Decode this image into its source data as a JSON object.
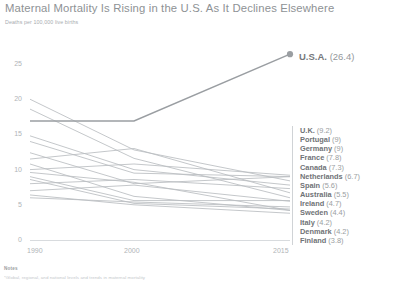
{
  "header": {
    "title": "Maternal Mortality Is Rising in the U.S. As It Declines Elsewhere",
    "subtitle": "Deaths per 100,000 live births"
  },
  "annotation": {
    "country": "U.S.A.",
    "value_label": "(26.4)"
  },
  "legend": {
    "items": [
      {
        "name": "U.K.",
        "value": "(9.2)"
      },
      {
        "name": "Portugal",
        "value": "(9)"
      },
      {
        "name": "Germany",
        "value": "(9)"
      },
      {
        "name": "France",
        "value": "(7.8)"
      },
      {
        "name": "Canada",
        "value": "(7.3)"
      },
      {
        "name": "Netherlands",
        "value": "(6.7)"
      },
      {
        "name": "Spain",
        "value": "(5.6)"
      },
      {
        "name": "Australia",
        "value": "(5.5)"
      },
      {
        "name": "Ireland",
        "value": "(4.7)"
      },
      {
        "name": "Sweden",
        "value": "(4.4)"
      },
      {
        "name": "Italy",
        "value": "(4.2)"
      },
      {
        "name": "Denmark",
        "value": "(4.2)"
      },
      {
        "name": "Finland",
        "value": "(3.8)"
      }
    ]
  },
  "notes": {
    "heading": "Notes",
    "body": "*Global, regional, and national levels and trends in maternal mortality"
  },
  "axis": {
    "y_ticks": [
      "0",
      "5",
      "10",
      "15",
      "20",
      "25"
    ],
    "x_ticks": [
      "1990",
      "2000",
      "2015"
    ]
  },
  "colors": {
    "line": "#b9bdc1",
    "usa_line": "#9a9ea2",
    "axis": "#d8dbde",
    "text": "#8e9295"
  },
  "chart_data": {
    "type": "line",
    "title": "Maternal Mortality Is Rising in the U.S. As It Declines Elsewhere",
    "subtitle": "Deaths per 100,000 live births",
    "xlabel": "",
    "ylabel": "Deaths per 100,000 live births",
    "xlim": [
      1990,
      2015
    ],
    "ylim": [
      0,
      26
    ],
    "y_ticks": [
      0,
      5,
      10,
      15,
      20,
      25
    ],
    "x_ticks": [
      1990,
      2000,
      2015
    ],
    "grid": false,
    "legend_position": "right",
    "highlight_series": "U.S.A.",
    "x": [
      1990,
      2000,
      2015
    ],
    "series": [
      {
        "name": "U.S.A.",
        "values": [
          16.9,
          16.9,
          26.4
        ],
        "highlight": true
      },
      {
        "name": "U.K.",
        "values": [
          10.0,
          10.8,
          9.2
        ]
      },
      {
        "name": "Portugal",
        "values": [
          14.0,
          9.5,
          9.0
        ]
      },
      {
        "name": "Germany",
        "values": [
          12.4,
          8.0,
          9.0
        ]
      },
      {
        "name": "France",
        "values": [
          14.8,
          10.0,
          7.8
        ]
      },
      {
        "name": "Canada",
        "values": [
          8.0,
          8.6,
          7.3
        ]
      },
      {
        "name": "Netherlands",
        "values": [
          11.5,
          13.0,
          6.7
        ]
      },
      {
        "name": "Spain",
        "values": [
          9.0,
          5.6,
          5.6
        ]
      },
      {
        "name": "Australia",
        "values": [
          7.0,
          7.8,
          5.5
        ]
      },
      {
        "name": "Ireland",
        "values": [
          6.0,
          5.4,
          4.7
        ]
      },
      {
        "name": "Sweden",
        "values": [
          8.6,
          5.2,
          4.4
        ]
      },
      {
        "name": "Italy",
        "values": [
          10.8,
          6.2,
          4.2
        ]
      },
      {
        "name": "Denmark",
        "values": [
          9.6,
          8.2,
          4.2
        ]
      },
      {
        "name": "Finland",
        "values": [
          6.4,
          5.0,
          3.8
        ]
      },
      {
        "name": "Other-A",
        "values": [
          20.0,
          12.8,
          8.4
        ]
      },
      {
        "name": "Other-B",
        "values": [
          18.6,
          11.6,
          6.0
        ]
      }
    ]
  }
}
